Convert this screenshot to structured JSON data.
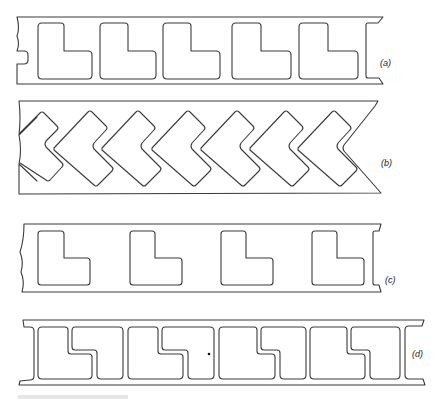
{
  "figure": {
    "panels": [
      {
        "id": "a",
        "label": "(a)",
        "description": "Strip with five evenly spaced L-shaped cut-outs, nested pattern"
      },
      {
        "id": "b",
        "label": "(b)",
        "description": "Strip with chevron (V-shaped) cut-outs nested diagonally, zig-zag ends"
      },
      {
        "id": "c",
        "label": "(c)",
        "description": "Strip with four spaced-apart L-shaped cut-outs"
      },
      {
        "id": "d",
        "label": "(d)",
        "description": "Strip with interlocking stepped (L/Z) cut-out pairs"
      }
    ],
    "stroke_color": "#3a3a3a",
    "background": "#ffffff"
  }
}
